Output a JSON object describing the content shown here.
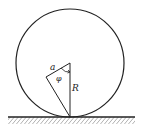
{
  "diagram": {
    "type": "physics-figure",
    "labels": {
      "offset": "a",
      "angle": "φ",
      "radius": "R"
    },
    "colors": {
      "stroke": "#222222",
      "background": "#ffffff",
      "hatch": "#555555"
    }
  }
}
